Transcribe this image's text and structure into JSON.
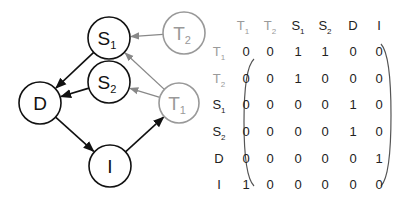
{
  "graph": {
    "nodes": [
      {
        "id": "S1",
        "base": "S",
        "sub": "1",
        "cx": 109,
        "cy": 38,
        "r": 21,
        "color": "#111111"
      },
      {
        "id": "S2",
        "base": "S",
        "sub": "2",
        "cx": 109,
        "cy": 82,
        "r": 21,
        "color": "#111111"
      },
      {
        "id": "D",
        "base": "D",
        "sub": "",
        "cx": 40,
        "cy": 103,
        "r": 21,
        "color": "#111111"
      },
      {
        "id": "I",
        "base": "I",
        "sub": "",
        "cx": 110,
        "cy": 166,
        "r": 21,
        "color": "#111111"
      },
      {
        "id": "T1",
        "base": "T",
        "sub": "1",
        "cx": 179,
        "cy": 103,
        "r": 20,
        "color": "#999999"
      },
      {
        "id": "T2",
        "base": "T",
        "sub": "2",
        "cx": 184,
        "cy": 33,
        "r": 21,
        "color": "#999999"
      }
    ],
    "edges": [
      {
        "from": "S1",
        "to": "D",
        "color": "#111111"
      },
      {
        "from": "S2",
        "to": "D",
        "color": "#111111"
      },
      {
        "from": "D",
        "to": "I",
        "color": "#111111"
      },
      {
        "from": "I",
        "to": "T1",
        "color": "#111111"
      },
      {
        "from": "T1",
        "to": "S1",
        "color": "#888888"
      },
      {
        "from": "T1",
        "to": "S2",
        "color": "#888888"
      },
      {
        "from": "T2",
        "to": "S1",
        "color": "#888888"
      }
    ]
  },
  "matrix": {
    "labels": [
      {
        "base": "T",
        "sub": "1",
        "color": "#9a9a9a"
      },
      {
        "base": "T",
        "sub": "2",
        "color": "#9a9a9a"
      },
      {
        "base": "S",
        "sub": "1",
        "color": "#222222"
      },
      {
        "base": "S",
        "sub": "2",
        "color": "#222222"
      },
      {
        "base": "D",
        "sub": "",
        "color": "#222222"
      },
      {
        "base": "I",
        "sub": "",
        "color": "#222222"
      }
    ],
    "rows": [
      [
        0,
        0,
        1,
        1,
        0,
        0
      ],
      [
        0,
        0,
        1,
        0,
        0,
        0
      ],
      [
        0,
        0,
        0,
        0,
        1,
        0
      ],
      [
        0,
        0,
        0,
        0,
        1,
        0
      ],
      [
        0,
        0,
        0,
        0,
        0,
        1
      ],
      [
        1,
        0,
        0,
        0,
        0,
        0
      ]
    ]
  }
}
